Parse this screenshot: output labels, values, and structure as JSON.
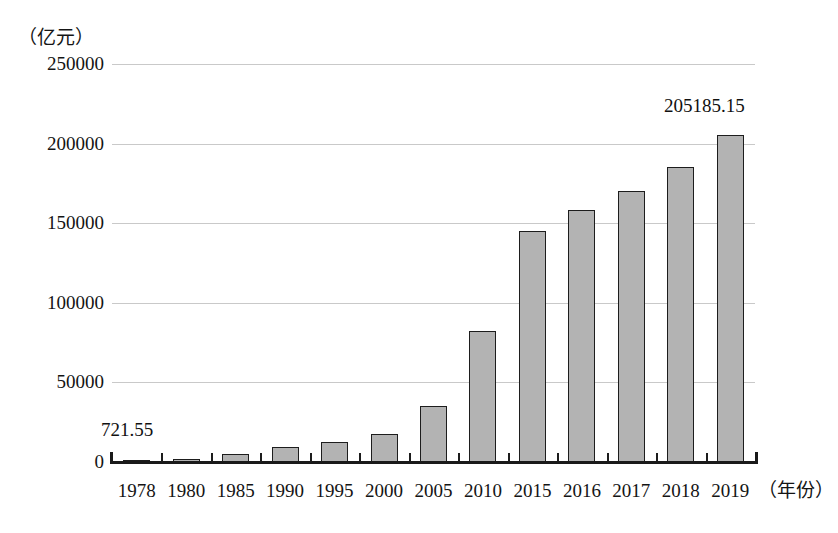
{
  "chart_data": {
    "type": "bar",
    "title": "",
    "subtitle": "",
    "xlabel": "（年份）",
    "ylabel": "（亿元）",
    "categories": [
      "1978",
      "1980",
      "1985",
      "1990",
      "1995",
      "2000",
      "2005",
      "2010",
      "2015",
      "2016",
      "2017",
      "2018",
      "2019"
    ],
    "values": [
      721.55,
      1200,
      2500,
      4200,
      5100,
      7800,
      18500,
      41200,
      72000,
      78000,
      86000,
      93000,
      205185.15
    ],
    "bar_values_display": [
      3650,
      3900,
      4600,
      5900,
      6600,
      9000,
      27500,
      64500,
      115500,
      125500,
      136000,
      147000,
      156000
    ],
    "yticks": [
      0,
      50000,
      100000,
      150000,
      200000,
      250000
    ],
    "ytick_labels": [
      "0",
      "50000",
      "100000",
      "150000",
      "200000",
      "250000"
    ],
    "ylim": [
      0,
      250000
    ],
    "grid": true,
    "legend": "none",
    "series": [
      {
        "name": "国内生产总值",
        "values": [
          721.55,
          4545.6,
          9016.0,
          18872.9,
          61339.9,
          100280.1,
          187318.9,
          412119.3,
          688858.2,
          746395.1,
          832035.9,
          919281.1,
          990865.1
        ]
      }
    ],
    "plotted_values": [
      721.55,
      2000,
      5000,
      9500,
      12500,
      17500,
      35000,
      82000,
      145000,
      158000,
      170500,
      185500,
      205185.15
    ],
    "annotations": [
      {
        "label": "721.55",
        "category": "1978",
        "position": "above-left"
      },
      {
        "label": "205185.15",
        "category": "2019",
        "position": "above"
      }
    ],
    "colors": {
      "bar_fill": "#b3b3b3",
      "bar_border": "#1d1d1d",
      "gridline": "#c9c9c9",
      "axis": "#1a1a1a",
      "text": "#141414",
      "background": "#ffffff"
    }
  }
}
